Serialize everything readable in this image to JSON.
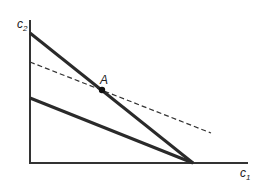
{
  "diagram": {
    "type": "budget-constraint",
    "axes": {
      "x_label": "c",
      "x_sub": "1",
      "y_label": "c",
      "y_sub": "2"
    },
    "point_label": "A",
    "lines": [
      {
        "name": "steep-budget-line",
        "style": "solid",
        "from": [
          30,
          33
        ],
        "to": [
          193,
          163
        ]
      },
      {
        "name": "flat-budget-line",
        "style": "solid",
        "from": [
          30,
          98
        ],
        "to": [
          193,
          163
        ]
      },
      {
        "name": "dashed-line",
        "style": "dashed",
        "from": [
          30,
          62
        ],
        "to": [
          211,
          133
        ]
      }
    ],
    "point_A": [
      102,
      90
    ],
    "colors": {
      "line": "#2a2a2a",
      "axis": "#333333"
    }
  }
}
